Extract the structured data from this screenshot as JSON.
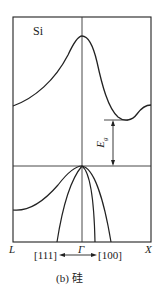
{
  "diagram": {
    "material_label": "Si",
    "gap_label": "E",
    "gap_subscript": "g",
    "k_points": {
      "left": "L",
      "center": "Γ",
      "right": "X"
    },
    "directions": {
      "left": "[111]",
      "right": "[100]"
    },
    "caption": "(b)  硅",
    "colors": {
      "line": "#222222",
      "background": "#ffffff"
    }
  }
}
